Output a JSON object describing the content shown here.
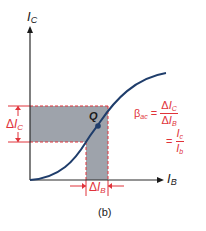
{
  "diagram": {
    "axes": {
      "y_label": {
        "main": "I",
        "sub": "C"
      },
      "x_label": {
        "main": "I",
        "sub": "B"
      }
    },
    "operating_point": {
      "label": "Q"
    },
    "delta_ic": {
      "prefix": "Δ",
      "main": "I",
      "sub": "C"
    },
    "delta_ib": {
      "prefix": "Δ",
      "main": "I",
      "sub": "B"
    },
    "formula": {
      "lhs": "β",
      "lhs_sub": "ac",
      "equals": "=",
      "frac1_num": {
        "prefix": "Δ",
        "main": "I",
        "sub": "C"
      },
      "frac1_den": {
        "prefix": "Δ",
        "main": "I",
        "sub": "B"
      },
      "equals2": "=",
      "frac2_num": {
        "main": "I",
        "sub": "c"
      },
      "frac2_den": {
        "main": "I",
        "sub": "b"
      }
    },
    "caption": "(b)",
    "colors": {
      "axis": "#2b2b2b",
      "curve": "#1f3d6b",
      "annotation": "#e0333a",
      "shade": "#9ea3ab"
    }
  }
}
